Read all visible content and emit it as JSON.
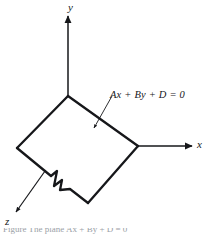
{
  "figure": {
    "kind": "3d-coordinate-plane-diagram",
    "background_color": "#ffffff",
    "ink_color": "#16171a",
    "dash_color": "#8d9196",
    "axes": [
      {
        "name": "y-axis",
        "label": "y",
        "direction": "up"
      },
      {
        "name": "x-axis",
        "label": "x",
        "direction": "right"
      },
      {
        "name": "z-axis",
        "label": "z",
        "direction": "down-left"
      }
    ],
    "annotation": {
      "equation": "Ax + By + D = 0",
      "leader_line": "points from equation text down-left into plane interior"
    },
    "plane": {
      "name": "plane-quadrilateral",
      "vertices": [
        {
          "name": "top",
          "x": 68,
          "y": 96
        },
        {
          "name": "right",
          "x": 138,
          "y": 146
        },
        {
          "name": "bottom",
          "x": 88,
          "y": 203
        },
        {
          "name": "left",
          "x": 17,
          "y": 148
        }
      ],
      "break_symbol": "zigzag break on lower-left edge"
    },
    "caption": {
      "text": "Figure   The plane  Ax + By + D = 0",
      "clipped": true
    }
  }
}
